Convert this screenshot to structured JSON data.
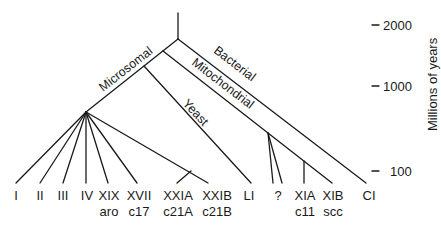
{
  "diagram": {
    "type": "phylogenetic-tree",
    "branches": {
      "microsomal": "Microsomal",
      "yeast": "Yeast",
      "mitochondrial": "Mitochondrial",
      "bacterial": "Bacterial"
    },
    "leaves": [
      {
        "id": "I",
        "top": "I",
        "bottom": ""
      },
      {
        "id": "II",
        "top": "II",
        "bottom": ""
      },
      {
        "id": "III",
        "top": "III",
        "bottom": ""
      },
      {
        "id": "IV",
        "top": "IV",
        "bottom": ""
      },
      {
        "id": "XIX",
        "top": "XIX",
        "bottom": "aro"
      },
      {
        "id": "XVII",
        "top": "XVII",
        "bottom": "c17"
      },
      {
        "id": "XXIA",
        "top": "XXIA",
        "bottom": "c21A"
      },
      {
        "id": "XXIB",
        "top": "XXIB",
        "bottom": "c21B"
      },
      {
        "id": "LI",
        "top": "LI",
        "bottom": ""
      },
      {
        "id": "unknown",
        "top": "?",
        "bottom": ""
      },
      {
        "id": "XIA",
        "top": "XIA",
        "bottom": "c11"
      },
      {
        "id": "XIB",
        "top": "XIB",
        "bottom": "scc"
      },
      {
        "id": "CI",
        "top": "CI",
        "bottom": ""
      }
    ],
    "axis": {
      "label": "Millions of years",
      "ticks": [
        "2000",
        "1000",
        "100"
      ]
    }
  }
}
